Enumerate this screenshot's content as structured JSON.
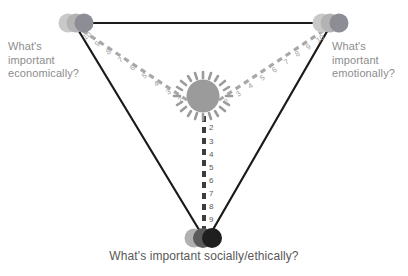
{
  "diagram": {
    "title_present": false,
    "background_color": "#ffffff",
    "vertices": [
      {
        "id": "economic",
        "label": "What's\nimportant\neconomically?",
        "label_color": "#8d8d8d",
        "position": {
          "x": 76,
          "y": 23
        },
        "node_type": "overlapping-circles",
        "circles": [
          {
            "cx": 68,
            "cy": 23,
            "r": 9.5,
            "color": "#c8c8c8"
          },
          {
            "cx": 76,
            "cy": 23,
            "r": 9.5,
            "color": "#b4b4b4"
          },
          {
            "cx": 84,
            "cy": 23,
            "r": 9.5,
            "color": "#8e8e96"
          }
        ]
      },
      {
        "id": "emotional",
        "label": "What's\nimportant\nemotionally?",
        "label_color": "#8d8d8d",
        "position": {
          "x": 330,
          "y": 23
        },
        "node_type": "overlapping-circles",
        "circles": [
          {
            "cx": 322,
            "cy": 23,
            "r": 9.5,
            "color": "#c8c8c8"
          },
          {
            "cx": 330,
            "cy": 23,
            "r": 9.5,
            "color": "#b4b4b4"
          },
          {
            "cx": 339,
            "cy": 23,
            "r": 9.5,
            "color": "#8e8e96"
          }
        ]
      },
      {
        "id": "social",
        "label": "What's important socially/ethically?",
        "label_color": "#585858",
        "position": {
          "x": 205,
          "y": 238
        },
        "node_type": "overlapping-circles",
        "circles": [
          {
            "cx": 194,
            "cy": 238,
            "r": 9.5,
            "color": "#b0b0b0"
          },
          {
            "cx": 203,
            "cy": 238,
            "r": 10,
            "color": "#595959"
          },
          {
            "cx": 212,
            "cy": 238,
            "r": 10,
            "color": "#1f1f1f"
          }
        ]
      }
    ],
    "hub": {
      "id": "center-hub",
      "position": {
        "x": 203,
        "y": 96
      },
      "radius": 16,
      "color": "#9b9b9b",
      "spoke_color": "#9b9b9b",
      "spoke_count": 18
    },
    "edges": [
      {
        "id": "edge-economic-emotional",
        "from": "economic",
        "to": "emotional",
        "style": "solid",
        "color": "#1a1a1a",
        "width": 2.2
      },
      {
        "id": "edge-economic-social",
        "from": "economic",
        "to": "social",
        "style": "solid",
        "color": "#1a1a1a",
        "width": 2.2
      },
      {
        "id": "edge-emotional-social",
        "from": "emotional",
        "to": "social",
        "style": "solid",
        "color": "#1a1a1a",
        "width": 2.2
      }
    ],
    "axes": [
      {
        "id": "axis-economic",
        "from": "hub",
        "to": "economic",
        "style": "dashed",
        "color": "#a8a8a8",
        "width": 3.2,
        "tick_labels": [
          "2",
          "3",
          "4",
          "5",
          "6",
          "7",
          "8",
          "9",
          "10"
        ],
        "tick_label_color": "#9a9a9a",
        "label_order": "inner-to-outer"
      },
      {
        "id": "axis-emotional",
        "from": "hub",
        "to": "emotional",
        "style": "dashed",
        "color": "#a8a8a8",
        "width": 3.2,
        "tick_labels": [
          "2",
          "3",
          "4",
          "5",
          "6",
          "7",
          "8",
          "9",
          "10"
        ],
        "tick_label_color": "#9a9a9a",
        "label_order": "inner-to-outer"
      },
      {
        "id": "axis-social",
        "from": "hub",
        "to": "social",
        "style": "dashed",
        "color": "#3d3d3d",
        "width": 4,
        "tick_labels": [
          "2",
          "3",
          "4",
          "5",
          "6",
          "7",
          "8",
          "9",
          "10"
        ],
        "tick_label_color": "#585858",
        "label_order": "inner-to-outer"
      }
    ]
  }
}
